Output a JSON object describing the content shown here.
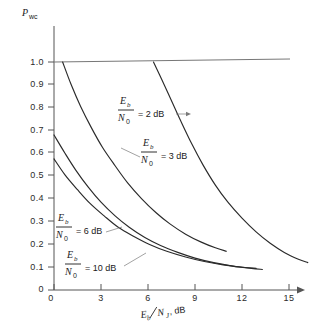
{
  "chart_data": {
    "type": "line",
    "title": "",
    "xlabel": "E_b/N_J, dB",
    "ylabel": "P_wc",
    "xlim": [
      0,
      16.5
    ],
    "ylim": [
      0,
      1.05
    ],
    "grid": false,
    "legend": "inline-annotations",
    "x_ticks": [
      0,
      3,
      6,
      9,
      12,
      15
    ],
    "x_tick_labels": [
      "0",
      "3",
      "6",
      "9",
      "12",
      "15"
    ],
    "y_ticks": [
      0,
      0.1,
      0.2,
      0.3,
      0.4,
      0.5,
      0.6,
      0.7,
      0.8,
      0.9,
      1.0
    ],
    "y_tick_labels": [
      "0",
      "0.1",
      "0.2",
      "0.3",
      "0.4",
      "0.5",
      "0.6",
      "0.7",
      "0.8",
      "0.9",
      "1.0"
    ],
    "reference_line": {
      "y": 1.0,
      "x_from": 0,
      "x_to": 16.0
    },
    "series": [
      {
        "name": "Eb/N0 = 2 dB",
        "label_numerator": "E",
        "label_numerator_sub": "b",
        "label_denominator": "N",
        "label_denominator_sub": "0",
        "label_value": "= 2 dB",
        "points": [
          [
            6.35,
            1.0
          ],
          [
            6.9,
            0.92
          ],
          [
            7.5,
            0.83
          ],
          [
            8.1,
            0.74
          ],
          [
            8.8,
            0.64
          ],
          [
            9.5,
            0.55
          ],
          [
            10.3,
            0.46
          ],
          [
            11.1,
            0.385
          ],
          [
            12.0,
            0.315
          ],
          [
            12.9,
            0.255
          ],
          [
            13.8,
            0.205
          ],
          [
            14.7,
            0.165
          ],
          [
            15.6,
            0.135
          ],
          [
            16.2,
            0.12
          ]
        ]
      },
      {
        "name": "Eb/N0 = 3 dB",
        "label_numerator": "E",
        "label_numerator_sub": "b",
        "label_denominator": "N",
        "label_denominator_sub": "0",
        "label_value": "= 3 dB",
        "points": [
          [
            0.55,
            1.0
          ],
          [
            1.1,
            0.9
          ],
          [
            1.7,
            0.805
          ],
          [
            2.4,
            0.71
          ],
          [
            3.1,
            0.625
          ],
          [
            3.9,
            0.545
          ],
          [
            4.7,
            0.47
          ],
          [
            5.6,
            0.4
          ],
          [
            6.5,
            0.34
          ],
          [
            7.4,
            0.29
          ],
          [
            8.4,
            0.245
          ],
          [
            9.4,
            0.21
          ],
          [
            10.3,
            0.185
          ],
          [
            11.0,
            0.17
          ]
        ]
      },
      {
        "name": "Eb/N0 = 6 dB",
        "label_numerator": "E",
        "label_numerator_sub": "b",
        "label_denominator": "N",
        "label_denominator_sub": "0",
        "label_value": "= 6 dB",
        "points": [
          [
            0.0,
            0.68
          ],
          [
            0.7,
            0.6
          ],
          [
            1.4,
            0.525
          ],
          [
            2.2,
            0.45
          ],
          [
            3.0,
            0.385
          ],
          [
            3.9,
            0.325
          ],
          [
            4.8,
            0.275
          ],
          [
            5.8,
            0.23
          ],
          [
            6.8,
            0.195
          ],
          [
            7.9,
            0.165
          ],
          [
            9.0,
            0.14
          ],
          [
            10.2,
            0.12
          ],
          [
            11.4,
            0.105
          ],
          [
            12.6,
            0.095
          ],
          [
            13.3,
            0.09
          ]
        ]
      },
      {
        "name": "Eb/N0 = 10 dB",
        "label_numerator": "E",
        "label_numerator_sub": "b",
        "label_denominator": "N",
        "label_denominator_sub": "0",
        "label_value": "= 10 dB",
        "points": [
          [
            0.0,
            0.575
          ],
          [
            0.7,
            0.505
          ],
          [
            1.5,
            0.44
          ],
          [
            2.3,
            0.38
          ],
          [
            3.2,
            0.325
          ],
          [
            4.1,
            0.275
          ],
          [
            5.1,
            0.235
          ],
          [
            6.1,
            0.2
          ],
          [
            7.2,
            0.17
          ],
          [
            8.4,
            0.145
          ],
          [
            9.6,
            0.125
          ],
          [
            10.8,
            0.11
          ],
          [
            12.0,
            0.1
          ],
          [
            12.9,
            0.095
          ]
        ]
      }
    ]
  },
  "axis": {
    "y_label": "P",
    "y_label_sub": "wc",
    "x_label_num": "E",
    "x_label_num_sub": "b",
    "x_label_den": "N",
    "x_label_den_sub": "J",
    "x_label_unit": ", dB"
  }
}
